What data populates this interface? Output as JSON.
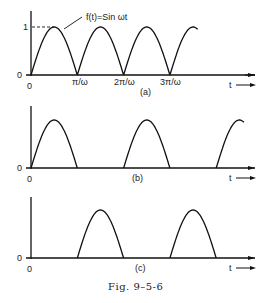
{
  "chart_data": [
    {
      "type": "line",
      "panel": "(a)",
      "title": "Full-wave rectified sine",
      "annotation": "f(t)=Sin ωt",
      "xlabel": "t",
      "ylabel": "",
      "y_ticks": [
        "0",
        "1"
      ],
      "x_ticks": [
        "0",
        "π/ω",
        "2π/ω",
        "3π/ω"
      ],
      "ylim": [
        0,
        1
      ],
      "description": "|sin ωt| — continuous half-sine humps",
      "humps": [
        [
          0,
          1
        ],
        [
          1,
          2
        ],
        [
          2,
          3
        ],
        [
          3,
          3.6
        ]
      ]
    },
    {
      "type": "line",
      "panel": "(b)",
      "title": "Half-wave rectified sine",
      "xlabel": "t",
      "y_ticks": [
        "0"
      ],
      "x_ticks": [
        "0"
      ],
      "description": "positive half-cycles only",
      "humps": [
        [
          0,
          1
        ],
        [
          2,
          3
        ],
        [
          4,
          4.6
        ]
      ]
    },
    {
      "type": "line",
      "panel": "(c)",
      "title": "Delayed half-wave rectified sine",
      "xlabel": "t",
      "y_ticks": [
        "0"
      ],
      "x_ticks": [
        "0"
      ],
      "description": "half-wave shifted by π/ω",
      "humps": [
        [
          1,
          2
        ],
        [
          3,
          4
        ]
      ]
    }
  ],
  "labels": {
    "a": {
      "panel": "(a)",
      "fn": "f(t)=Sin ωt",
      "one": "1",
      "zero_y": "0",
      "zero_x": "0",
      "t1": "π/ω",
      "t2": "2π/ω",
      "t3": "3π/ω",
      "t": "t"
    },
    "b": {
      "panel": "(b)",
      "zero_y": "0",
      "zero_x": "0",
      "t": "t"
    },
    "c": {
      "panel": "(c)",
      "zero_y": "0",
      "zero_x": "0",
      "t": "t"
    },
    "caption": "Fig. 9–5-6"
  }
}
